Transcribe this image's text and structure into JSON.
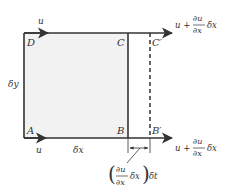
{
  "diagram": {
    "colors": {
      "fill": "#f2f2f2",
      "stroke": "#333333",
      "background": "#ffffff"
    },
    "vertices": {
      "A": "A",
      "B": "B",
      "C": "C",
      "D": "D",
      "B_prime": "B′",
      "C_prime": "C′"
    },
    "velocity_labels": {
      "top_left": "u",
      "bottom_left": "u",
      "top_right_u": "u +",
      "bottom_right_u": "u +",
      "partial_num": "∂u",
      "partial_den": "∂x",
      "delta_x_suffix": "δx"
    },
    "dimension_labels": {
      "height": "δy",
      "width": "δx"
    },
    "displacement_label": {
      "open_paren": "(",
      "num": "∂u",
      "den": "∂x",
      "mid": "δx",
      "close_paren": ")",
      "suffix": "δt"
    }
  }
}
